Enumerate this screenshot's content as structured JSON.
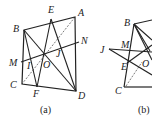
{
  "figures": [
    {
      "caption": "(a)",
      "points": {
        "A": [
          75,
          17
        ],
        "B": [
          24,
          30
        ],
        "C": [
          22,
          84
        ],
        "D": [
          76,
          91
        ],
        "E": [
          51,
          19
        ],
        "F": [
          37,
          87
        ],
        "M": [
          21,
          62
        ],
        "N": [
          79,
          42
        ],
        "O": [
          44,
          53
        ],
        "I": [
          30,
          60
        ],
        "J": [
          55,
          47
        ]
      },
      "labels": {
        "A": [
          78,
          16
        ],
        "B": [
          13,
          32
        ],
        "C": [
          10,
          88
        ],
        "D": [
          78,
          99
        ],
        "E": [
          48,
          13
        ],
        "F": [
          33,
          97
        ],
        "M": [
          9,
          66
        ],
        "N": [
          81,
          44
        ],
        "O": [
          43,
          68
        ],
        "I": [
          27,
          69
        ],
        "J": [
          56,
          57
        ]
      }
    },
    {
      "caption": "(b)",
      "labels": {
        "B": [
          125,
          26
        ],
        "J": [
          99,
          53
        ],
        "M": [
          121,
          48
        ],
        "E": [
          123,
          68
        ],
        "O": [
          142,
          67
        ],
        "C": [
          116,
          93
        ]
      }
    }
  ]
}
